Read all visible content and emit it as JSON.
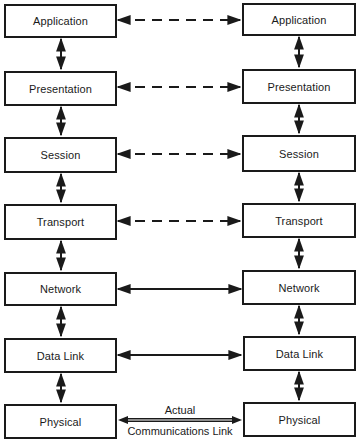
{
  "diagram": {
    "type": "layered-protocol-stack",
    "left_stack": {
      "layers": [
        {
          "label": "Application"
        },
        {
          "label": "Presentation"
        },
        {
          "label": "Session"
        },
        {
          "label": "Transport"
        },
        {
          "label": "Network"
        },
        {
          "label": "Data Link"
        },
        {
          "label": "Physical"
        }
      ]
    },
    "right_stack": {
      "layers": [
        {
          "label": "Application"
        },
        {
          "label": "Presentation"
        },
        {
          "label": "Session"
        },
        {
          "label": "Transport"
        },
        {
          "label": "Network"
        },
        {
          "label": "Data Link"
        },
        {
          "label": "Physical"
        }
      ]
    },
    "peer_links": [
      {
        "layer": "Application",
        "style": "dashed"
      },
      {
        "layer": "Presentation",
        "style": "dashed"
      },
      {
        "layer": "Session",
        "style": "dashed"
      },
      {
        "layer": "Transport",
        "style": "dashed"
      },
      {
        "layer": "Network",
        "style": "solid"
      },
      {
        "layer": "Data Link",
        "style": "solid"
      },
      {
        "layer": "Physical",
        "style": "double"
      }
    ],
    "physical_link_label": {
      "top": "Actual",
      "bottom": "Communications Link"
    },
    "colors": {
      "line": "#1a1a1a",
      "background": "#ffffff"
    }
  }
}
